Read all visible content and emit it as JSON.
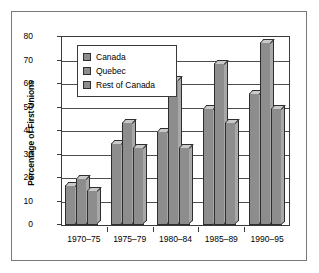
{
  "chart_data": {
    "type": "bar",
    "title": "",
    "xlabel": "",
    "ylabel": "Percentage of First Unions",
    "ylim": [
      0,
      80
    ],
    "yticks": [
      0,
      10,
      20,
      30,
      40,
      50,
      60,
      70,
      80
    ],
    "grid": true,
    "legend_position": "top-left",
    "categories": [
      "1970–75",
      "1975–79",
      "1980–84",
      "1985–89",
      "1990–95"
    ],
    "series": [
      {
        "name": "Canada",
        "values": [
          17,
          35,
          40,
          50,
          56
        ]
      },
      {
        "name": "Quebec",
        "values": [
          20,
          44,
          62,
          69,
          78
        ]
      },
      {
        "name": "Rest of Canada",
        "values": [
          15,
          33,
          33,
          44,
          50
        ]
      }
    ],
    "colors": {
      "bar_face": "#8d8d8d",
      "bar_top": "#c9c9c9",
      "bar_side": "#a8a8a8",
      "bar_edge": "#2e2e2e",
      "grid": "#4d4d4d",
      "frame": "#7a7a7a",
      "axis": "#3a3a3a"
    }
  },
  "legend": {
    "items": [
      {
        "label": "Canada"
      },
      {
        "label": "Quebec"
      },
      {
        "label": "Rest of Canada"
      }
    ]
  }
}
